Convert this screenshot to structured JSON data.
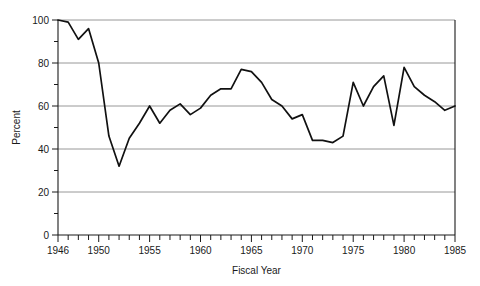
{
  "chart_data": {
    "type": "line",
    "title": "",
    "subtitle": "",
    "xlabel": "Fiscal Year",
    "ylabel": "Percent",
    "xlim": [
      1946,
      1985
    ],
    "ylim": [
      0,
      100
    ],
    "grid": "horizontal-major",
    "legend": "none",
    "y_major_ticks": [
      0,
      20,
      40,
      60,
      80,
      100
    ],
    "y_minor_ticks": [
      10,
      30,
      50,
      70,
      90
    ],
    "y_tick_labels": [
      "0",
      "20",
      "40",
      "60",
      "80",
      "100"
    ],
    "x_major_ticks": [
      1946,
      1950,
      1955,
      1960,
      1965,
      1970,
      1975,
      1980,
      1985
    ],
    "x_tick_labels": [
      "1946",
      "1950",
      "1955",
      "1960",
      "1965",
      "1970",
      "1975",
      "1980",
      "1985"
    ],
    "x_tick_interval": 1,
    "x": [
      1946,
      1947,
      1948,
      1949,
      1950,
      1951,
      1952,
      1953,
      1954,
      1955,
      1956,
      1957,
      1958,
      1959,
      1960,
      1961,
      1962,
      1963,
      1964,
      1965,
      1966,
      1967,
      1968,
      1969,
      1970,
      1971,
      1972,
      1973,
      1974,
      1975,
      1976,
      1977,
      1978,
      1979,
      1980,
      1981,
      1982,
      1983,
      1984,
      1985
    ],
    "values": [
      100,
      99,
      91,
      96,
      80,
      46,
      32,
      45,
      52,
      60,
      52,
      58,
      61,
      56,
      59,
      65,
      68,
      68,
      77,
      76,
      71,
      63,
      60,
      54,
      56,
      44,
      44,
      43,
      46,
      71,
      60,
      69,
      74,
      51,
      78,
      69,
      65,
      62,
      58,
      60
    ],
    "series": [
      {
        "name": "Percent",
        "color": "#111111",
        "values": [
          100,
          99,
          91,
          96,
          80,
          46,
          32,
          45,
          52,
          60,
          52,
          58,
          61,
          56,
          59,
          65,
          68,
          68,
          77,
          76,
          71,
          63,
          60,
          54,
          56,
          44,
          44,
          43,
          46,
          71,
          60,
          69,
          74,
          51,
          78,
          69,
          65,
          62,
          58,
          60
        ]
      }
    ]
  }
}
